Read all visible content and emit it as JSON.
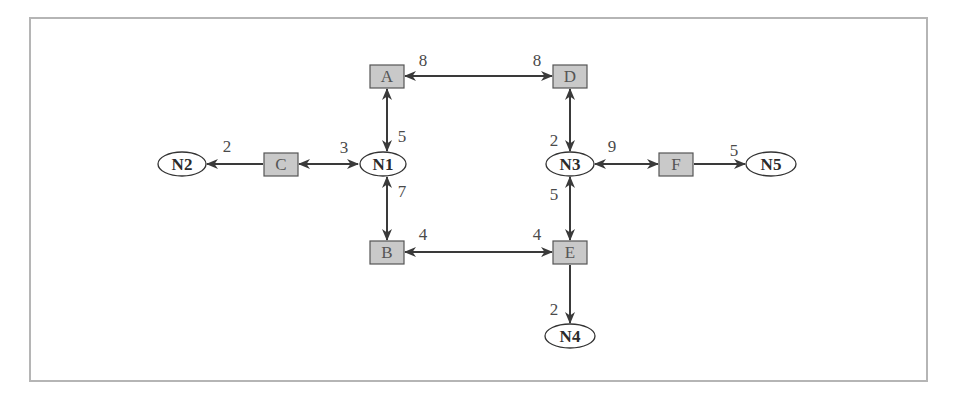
{
  "diagram": {
    "type": "network-graph",
    "routers": [
      {
        "id": "A",
        "label": "A",
        "cx": 387,
        "cy": 76
      },
      {
        "id": "B",
        "label": "B",
        "cx": 387,
        "cy": 252
      },
      {
        "id": "C",
        "label": "C",
        "cx": 281,
        "cy": 164
      },
      {
        "id": "D",
        "label": "D",
        "cx": 570,
        "cy": 76
      },
      {
        "id": "E",
        "label": "E",
        "cx": 570,
        "cy": 252
      },
      {
        "id": "F",
        "label": "F",
        "cx": 676,
        "cy": 164
      }
    ],
    "networks": [
      {
        "id": "N1",
        "label": "N1",
        "cx": 382,
        "cy": 164
      },
      {
        "id": "N2",
        "label": "N2",
        "cx": 182,
        "cy": 164
      },
      {
        "id": "N3",
        "label": "N3",
        "cx": 570,
        "cy": 164
      },
      {
        "id": "N4",
        "label": "N4",
        "cx": 570,
        "cy": 336
      },
      {
        "id": "N5",
        "label": "N5",
        "cx": 770,
        "cy": 164
      }
    ],
    "links": [
      {
        "from": "A",
        "to": "D",
        "direction": "both",
        "weights": [
          {
            "label": "8",
            "near": "A"
          },
          {
            "label": "8",
            "near": "D"
          }
        ]
      },
      {
        "from": "A",
        "to": "N1",
        "direction": "both",
        "weights": [
          {
            "label": "5",
            "near": "N1"
          }
        ]
      },
      {
        "from": "C",
        "to": "N1",
        "direction": "both",
        "weights": [
          {
            "label": "3",
            "near": "N1"
          }
        ]
      },
      {
        "from": "C",
        "to": "N2",
        "direction": "to",
        "weights": [
          {
            "label": "2",
            "near": "N2"
          }
        ]
      },
      {
        "from": "N1",
        "to": "B",
        "direction": "both",
        "weights": [
          {
            "label": "7",
            "near": "N1"
          }
        ]
      },
      {
        "from": "B",
        "to": "E",
        "direction": "both",
        "weights": [
          {
            "label": "4",
            "near": "B"
          },
          {
            "label": "4",
            "near": "E"
          }
        ]
      },
      {
        "from": "D",
        "to": "N3",
        "direction": "both",
        "weights": [
          {
            "label": "2",
            "near": "N3"
          }
        ]
      },
      {
        "from": "N3",
        "to": "F",
        "direction": "both",
        "weights": [
          {
            "label": "9",
            "near": "N3"
          }
        ]
      },
      {
        "from": "F",
        "to": "N5",
        "direction": "to",
        "weights": [
          {
            "label": "5",
            "near": "N5"
          }
        ]
      },
      {
        "from": "N3",
        "to": "E",
        "direction": "both",
        "weights": [
          {
            "label": "5",
            "near": "N3"
          }
        ]
      },
      {
        "from": "E",
        "to": "N4",
        "direction": "to",
        "weights": [
          {
            "label": "2",
            "near": "N4"
          }
        ]
      }
    ],
    "weight_labels": {
      "ad_a": "8",
      "ad_d": "8",
      "an1": "5",
      "cn1": "3",
      "cn2": "2",
      "n1b": "7",
      "be_b": "4",
      "be_e": "4",
      "dn3": "2",
      "n3f": "9",
      "fn5": "5",
      "n3e": "5",
      "en4": "2"
    },
    "colors": {
      "router_fill": "#c9c9c9",
      "router_stroke": "#555555",
      "network_fill": "#ffffff",
      "edge": "#3a3a3a",
      "frame": "#b5b5b5"
    }
  }
}
